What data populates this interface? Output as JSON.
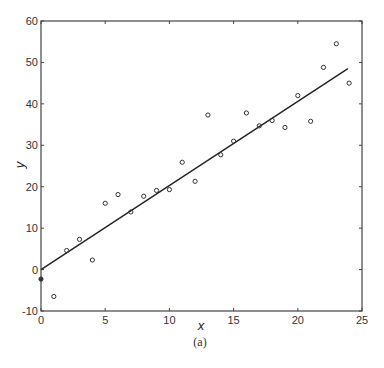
{
  "chart_data": {
    "type": "scatter",
    "title": "",
    "caption": "(a)",
    "xlabel": "x",
    "ylabel": "y",
    "xlim": [
      0,
      25
    ],
    "ylim": [
      -10,
      60
    ],
    "xticks": [
      0,
      5,
      10,
      15,
      20,
      25
    ],
    "yticks": [
      -10,
      0,
      10,
      20,
      30,
      40,
      50,
      60
    ],
    "grid": false,
    "legend": null,
    "series": [
      {
        "name": "observations",
        "marker": "open-circle",
        "x": [
          0,
          1,
          2,
          3,
          4,
          5,
          6,
          7,
          8,
          9,
          10,
          11,
          12,
          13,
          14,
          15,
          16,
          17,
          18,
          19,
          20,
          21,
          22,
          23,
          24
        ],
        "y": [
          -2.3,
          -6.5,
          4.6,
          7.3,
          2.3,
          16.0,
          18.1,
          13.9,
          17.7,
          19.1,
          19.3,
          25.9,
          21.3,
          37.3,
          27.7,
          31.0,
          37.8,
          34.7,
          36.0,
          34.3,
          42.0,
          35.8,
          48.8,
          54.5,
          45.0
        ]
      },
      {
        "name": "fitted line",
        "type": "line",
        "x": [
          0,
          23.9
        ],
        "y": [
          0,
          48.5
        ]
      }
    ]
  },
  "plot_frame": {
    "left_px": 41,
    "right_px": 362,
    "top_px": 21,
    "bottom_px": 311
  }
}
